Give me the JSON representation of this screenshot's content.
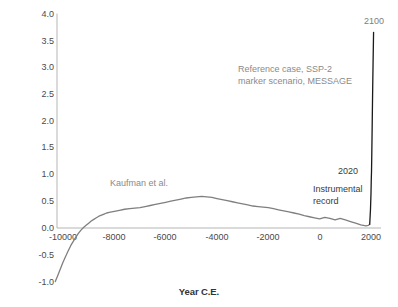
{
  "chart_data": {
    "type": "line",
    "title": "",
    "xlabel": "Year C.E.",
    "ylabel": "Temp. Anomaly from 1850-1900 Average °C",
    "xlim": [
      -10400,
      2150
    ],
    "ylim": [
      -1.0,
      4.0
    ],
    "grid": false,
    "legend": "none",
    "xticks": [
      "-10000",
      "-8000",
      "-6000",
      "-4000",
      "-2000",
      "0",
      "2000"
    ],
    "xtick_values": [
      -10000,
      -8000,
      -6000,
      -4000,
      -2000,
      0,
      2000
    ],
    "yticks": [
      "4.0",
      "3.5",
      "3.0",
      "2.5",
      "2.0",
      "1.5",
      "1.0",
      "0.5",
      "0.0",
      "-0.5",
      "-1.0"
    ],
    "ytick_values": [
      4.0,
      3.5,
      3.0,
      2.5,
      2.0,
      1.5,
      1.0,
      0.5,
      0.0,
      -0.5,
      -1.0
    ],
    "series": [
      {
        "name": "Kaufman et al.",
        "color": "#7f7f7f",
        "x": [
          -10300,
          -10200,
          -10100,
          -10000,
          -9900,
          -9800,
          -9700,
          -9600,
          -9500,
          -9400,
          -9300,
          -9200,
          -9100,
          -9000,
          -8900,
          -8800,
          -8700,
          -8600,
          -8500,
          -8400,
          -8300,
          -8200,
          -8100,
          -8000,
          -7800,
          -7600,
          -7400,
          -7200,
          -7000,
          -6800,
          -6600,
          -6400,
          -6200,
          -6000,
          -5800,
          -5600,
          -5400,
          -5200,
          -5000,
          -4800,
          -4600,
          -4400,
          -4200,
          -4000,
          -3800,
          -3600,
          -3400,
          -3200,
          -3000,
          -2800,
          -2600,
          -2400,
          -2200,
          -2000,
          -1800,
          -1600,
          -1400,
          -1200,
          -1000,
          -800,
          -600,
          -400,
          -200,
          0,
          200,
          400,
          600,
          800,
          1000,
          1200,
          1400,
          1600,
          1800,
          1900,
          1950
        ],
        "y": [
          -1.0,
          -0.88,
          -0.76,
          -0.64,
          -0.53,
          -0.43,
          -0.33,
          -0.25,
          -0.17,
          -0.1,
          -0.04,
          0.01,
          0.05,
          0.09,
          0.13,
          0.16,
          0.19,
          0.22,
          0.24,
          0.26,
          0.28,
          0.29,
          0.3,
          0.31,
          0.33,
          0.35,
          0.36,
          0.37,
          0.38,
          0.4,
          0.42,
          0.44,
          0.46,
          0.48,
          0.5,
          0.52,
          0.54,
          0.56,
          0.57,
          0.58,
          0.59,
          0.58,
          0.57,
          0.55,
          0.53,
          0.51,
          0.49,
          0.47,
          0.45,
          0.43,
          0.41,
          0.4,
          0.39,
          0.38,
          0.36,
          0.34,
          0.32,
          0.3,
          0.28,
          0.26,
          0.23,
          0.21,
          0.19,
          0.17,
          0.2,
          0.18,
          0.15,
          0.18,
          0.15,
          0.12,
          0.09,
          0.06,
          0.04,
          0.05,
          0.07
        ]
      },
      {
        "name": "Instrumental record and SSP-2 projection",
        "color": "#1a1a1a",
        "x": [
          1950,
          1980,
          2000,
          2010,
          2020,
          2030,
          2040,
          2050,
          2060,
          2070,
          2080,
          2090,
          2100
        ],
        "y": [
          0.07,
          0.35,
          0.65,
          0.9,
          1.05,
          1.35,
          1.7,
          2.05,
          2.4,
          2.75,
          3.05,
          3.35,
          3.65
        ]
      }
    ],
    "annotations": [
      {
        "name": "scenario-note",
        "text": "Reference case, SSP-2\nmarker scenario, MESSAGE",
        "color": "#8a8a8a"
      },
      {
        "name": "kaufman-label",
        "text": "Kaufman et al.",
        "color": "#8a8a8a"
      },
      {
        "name": "year-2100-label",
        "text": "2100",
        "color": "#8a8a8a"
      },
      {
        "name": "year-2020-label",
        "text": "2020",
        "color": "#3a3a3a"
      },
      {
        "name": "instrumental-record-label",
        "text": "Instrumental\nrecord",
        "color": "#3a3a3a"
      }
    ],
    "colors": {
      "proxy_line": "#7f7f7f",
      "projection_line": "#1a1a1a",
      "axis": "#b5b5b5",
      "tick_text": "#4a4a4a",
      "annotation_gray": "#8a8a8a",
      "annotation_dark": "#3a3a3a",
      "background": "#ffffff"
    }
  },
  "axes": {
    "y_title": "Temp. Anomaly from 1850-1900 Average °C",
    "x_title": "Year C.E.",
    "yticks": [
      {
        "label": "4.0"
      },
      {
        "label": "3.5"
      },
      {
        "label": "3.0"
      },
      {
        "label": "2.5"
      },
      {
        "label": "2.0"
      },
      {
        "label": "1.5"
      },
      {
        "label": "1.0"
      },
      {
        "label": "0.5"
      },
      {
        "label": "0.0"
      },
      {
        "label": "-0.5"
      },
      {
        "label": "-1.0"
      }
    ],
    "xticks": [
      {
        "label": "-10000"
      },
      {
        "label": "-8000"
      },
      {
        "label": "-6000"
      },
      {
        "label": "-4000"
      },
      {
        "label": "-2000"
      },
      {
        "label": "0"
      },
      {
        "label": "2000"
      }
    ]
  },
  "annotations": {
    "scenario": "Reference case, SSP-2\nmarker scenario, MESSAGE",
    "kaufman": "Kaufman et al.",
    "year_2100": "2100",
    "year_2020": "2020",
    "instrumental": "Instrumental\nrecord"
  }
}
